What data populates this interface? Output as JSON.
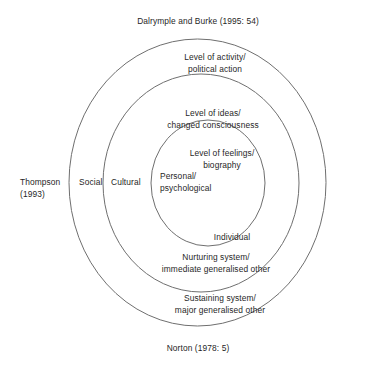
{
  "diagram": {
    "type": "nested-circles",
    "title_top": "Dalrymple and Burke (1995: 54)",
    "title_bottom": "Norton (1978: 5)",
    "side_citation": "Thompson\n(1993)",
    "background_color": "#ffffff",
    "stroke_color": "#6f6f6f",
    "text_color": "#1f1f1f",
    "rings": [
      {
        "name": "outer-ring",
        "inner_label": "Level of activity/\npolitical action",
        "outer_label": "Sustaining system/\nmajor generalised other",
        "edge_label": "Social"
      },
      {
        "name": "middle-ring",
        "inner_label": "Level of ideas/\nchanged consciousness",
        "outer_label": "Nurturing system/\nimmediate generalised other",
        "edge_label": "Cultural"
      },
      {
        "name": "inner-ring",
        "inner_label": "Level of feelings/\nbiography",
        "outer_label": "Individual",
        "edge_label": "Personal/\npsychological"
      }
    ]
  }
}
